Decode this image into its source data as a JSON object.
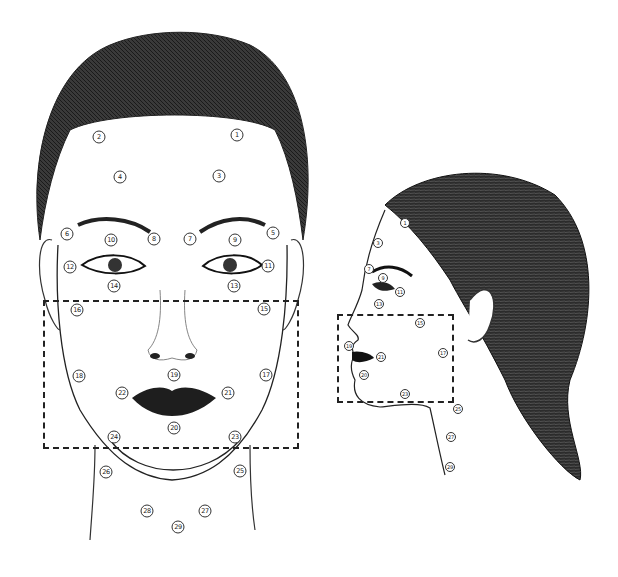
{
  "diagram": {
    "colors": {
      "ink": "#1a1a1a",
      "hair": "#2a2a2a",
      "background": "#ffffff",
      "marker_border": "#333333"
    },
    "front_view": {
      "markers": [
        {
          "n": "1",
          "x": 237,
          "y": 135
        },
        {
          "n": "2",
          "x": 99,
          "y": 137
        },
        {
          "n": "3",
          "x": 219,
          "y": 176
        },
        {
          "n": "4",
          "x": 120,
          "y": 177
        },
        {
          "n": "5",
          "x": 273,
          "y": 233
        },
        {
          "n": "6",
          "x": 67,
          "y": 234
        },
        {
          "n": "7",
          "x": 190,
          "y": 239
        },
        {
          "n": "8",
          "x": 154,
          "y": 239
        },
        {
          "n": "9",
          "x": 235,
          "y": 240
        },
        {
          "n": "10",
          "x": 111,
          "y": 240
        },
        {
          "n": "11",
          "x": 268,
          "y": 266
        },
        {
          "n": "12",
          "x": 70,
          "y": 267
        },
        {
          "n": "13",
          "x": 234,
          "y": 286
        },
        {
          "n": "14",
          "x": 114,
          "y": 286
        },
        {
          "n": "15",
          "x": 264,
          "y": 309
        },
        {
          "n": "16",
          "x": 77,
          "y": 310
        },
        {
          "n": "17",
          "x": 266,
          "y": 375
        },
        {
          "n": "18",
          "x": 79,
          "y": 376
        },
        {
          "n": "19",
          "x": 174,
          "y": 375
        },
        {
          "n": "21",
          "x": 228,
          "y": 393
        },
        {
          "n": "22",
          "x": 122,
          "y": 393
        },
        {
          "n": "20",
          "x": 174,
          "y": 428
        },
        {
          "n": "23",
          "x": 235,
          "y": 437
        },
        {
          "n": "24",
          "x": 114,
          "y": 437
        },
        {
          "n": "25",
          "x": 240,
          "y": 471
        },
        {
          "n": "26",
          "x": 106,
          "y": 472
        },
        {
          "n": "27",
          "x": 205,
          "y": 511
        },
        {
          "n": "28",
          "x": 147,
          "y": 511
        },
        {
          "n": "29",
          "x": 178,
          "y": 527
        }
      ],
      "zone": {
        "x": 43,
        "y": 300,
        "w": 256,
        "h": 149
      }
    },
    "profile_view": {
      "markers": [
        {
          "n": "1",
          "x": 405,
          "y": 223
        },
        {
          "n": "3",
          "x": 378,
          "y": 243
        },
        {
          "n": "7",
          "x": 369,
          "y": 269
        },
        {
          "n": "9",
          "x": 383,
          "y": 278
        },
        {
          "n": "11",
          "x": 400,
          "y": 292
        },
        {
          "n": "13",
          "x": 379,
          "y": 304
        },
        {
          "n": "15",
          "x": 420,
          "y": 323
        },
        {
          "n": "19",
          "x": 349,
          "y": 346
        },
        {
          "n": "21",
          "x": 381,
          "y": 357
        },
        {
          "n": "17",
          "x": 443,
          "y": 353
        },
        {
          "n": "20",
          "x": 364,
          "y": 375
        },
        {
          "n": "23",
          "x": 405,
          "y": 394
        },
        {
          "n": "25",
          "x": 458,
          "y": 409
        },
        {
          "n": "27",
          "x": 451,
          "y": 437
        },
        {
          "n": "29",
          "x": 450,
          "y": 467
        }
      ],
      "zone": {
        "x": 337,
        "y": 314,
        "w": 117,
        "h": 89
      }
    }
  }
}
